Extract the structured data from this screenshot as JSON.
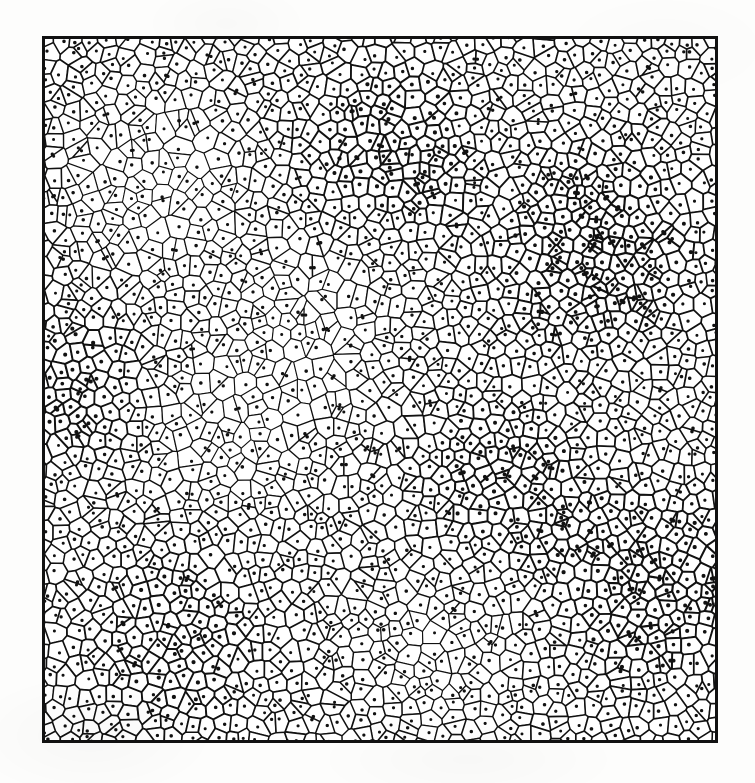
{
  "figure": {
    "kind": "voronoi-tessellation",
    "caption": "",
    "title": "",
    "background_color": "#fdfdfc",
    "ink_color": "#111111",
    "cell_fill_color": "#ffffff"
  },
  "canvas": {
    "width": 755,
    "height": 783
  },
  "plot_area": {
    "left": 42,
    "top": 36,
    "width": 676,
    "height": 707,
    "frame_thickness": 3,
    "frame_color": "#111111"
  },
  "chart_data": {
    "type": "scatter",
    "title": "",
    "subtitle": "",
    "xlabel": "",
    "ylabel": "",
    "xlim": [
      0,
      676
    ],
    "ylim": [
      0,
      707
    ],
    "grid": false,
    "legend": false,
    "legend_position": "none",
    "tick_labels_x": [],
    "tick_labels_y": [],
    "annotations": [],
    "description": "Planar Voronoi (Dirichlet) tessellation of a square region generated from a perturbed-lattice point pattern; every convex cell encloses exactly one generating seed point drawn as a small filled dot.",
    "series": [
      {
        "name": "seed-points",
        "marker": "filled-circle",
        "marker_radius_px": 1.6,
        "color": "#111111",
        "approx_count": 2050
      },
      {
        "name": "voronoi-edges",
        "marker": "polygon-outline",
        "stroke_width_px": 1.5,
        "color": "#111111"
      }
    ],
    "generation": {
      "seed": 20240517,
      "pattern": "jittered-lattice",
      "nominal_columns": 50,
      "nominal_rows": 52,
      "jitter_fraction": 0.48,
      "mean_cell_diameter_px": 14.5,
      "min_cell_diameter_px": 5,
      "max_cell_diameter_px": 34,
      "density_modulation": {
        "enabled": true,
        "blobs": [
          {
            "cx": 0.18,
            "cy": 0.22,
            "r": 0.24,
            "amp": -0.3
          },
          {
            "cx": 0.52,
            "cy": 0.16,
            "r": 0.22,
            "amp": 0.28
          },
          {
            "cx": 0.82,
            "cy": 0.3,
            "r": 0.26,
            "amp": 0.34
          },
          {
            "cx": 0.3,
            "cy": 0.55,
            "r": 0.25,
            "amp": -0.26
          },
          {
            "cx": 0.68,
            "cy": 0.62,
            "r": 0.23,
            "amp": 0.24
          },
          {
            "cx": 0.2,
            "cy": 0.85,
            "r": 0.24,
            "amp": 0.22
          },
          {
            "cx": 0.58,
            "cy": 0.88,
            "r": 0.22,
            "amp": -0.2
          },
          {
            "cx": 0.9,
            "cy": 0.78,
            "r": 0.24,
            "amp": 0.3
          },
          {
            "cx": 0.42,
            "cy": 0.38,
            "r": 0.2,
            "amp": -0.22
          },
          {
            "cx": 0.06,
            "cy": 0.5,
            "r": 0.18,
            "amp": 0.26
          }
        ]
      },
      "edge_darkening": {
        "enabled": true,
        "note": "cells in high-density clusters are drawn with heavier overlapping ink, producing the dark speckled patches"
      }
    }
  }
}
